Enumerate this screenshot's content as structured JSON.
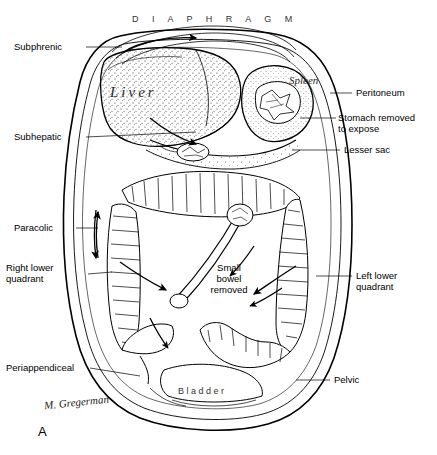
{
  "figure": {
    "panel_letter": "A",
    "signature": "M. Gregerman",
    "organ_words": {
      "diaphragm": "D I A P H R A G M",
      "liver": "Liver",
      "spleen": "Spleen",
      "bladder": "Bladder"
    }
  },
  "labels": {
    "left": [
      {
        "id": "subphrenic",
        "text": "Subphrenic"
      },
      {
        "id": "subhepatic",
        "text": "Subhepatic"
      },
      {
        "id": "paracolic",
        "text": "Paracolic"
      },
      {
        "id": "right_lower_quadrant",
        "text": "Right lower\nquadrant"
      },
      {
        "id": "periappendiceal",
        "text": "Periappendiceal"
      }
    ],
    "right": [
      {
        "id": "peritoneum",
        "text": "Peritoneum"
      },
      {
        "id": "stomach_removed",
        "text": "Stomach removed\nto expose"
      },
      {
        "id": "lesser_sac",
        "text": "Lesser sac"
      },
      {
        "id": "left_lower_quadrant",
        "text": "Left lower\nquadrant"
      },
      {
        "id": "pelvic",
        "text": "Pelvic"
      }
    ],
    "inner": [
      {
        "id": "small_bowel_removed",
        "text": "Small\nbowel\nremoved"
      }
    ]
  }
}
